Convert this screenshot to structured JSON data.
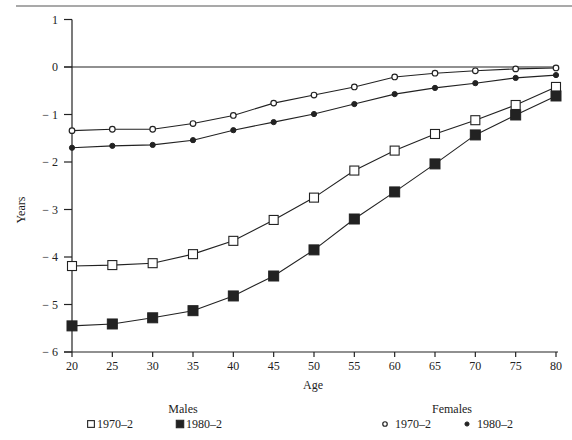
{
  "chart_data": {
    "type": "line",
    "title": "",
    "xlabel": "Age",
    "ylabel": "Years",
    "xlim": [
      20,
      80
    ],
    "ylim": [
      -6,
      1
    ],
    "x_ticks": [
      20,
      25,
      30,
      35,
      40,
      45,
      50,
      55,
      60,
      65,
      70,
      75,
      80
    ],
    "y_ticks": [
      1,
      0,
      -1,
      -2,
      -3,
      -4,
      -5,
      -6
    ],
    "y_tick_labels": [
      "1",
      "0",
      "− 1",
      "− 2",
      "− 3",
      "− 4",
      "− 5",
      "− 6"
    ],
    "grid": false,
    "reference_line_y": 0,
    "x": [
      20,
      25,
      30,
      35,
      40,
      45,
      50,
      55,
      60,
      65,
      70,
      75,
      80
    ],
    "series": [
      {
        "name": "Males 1970–2",
        "group": "Males",
        "marker": "open-square",
        "values": [
          -4.19,
          -4.17,
          -4.13,
          -3.94,
          -3.66,
          -3.22,
          -2.75,
          -2.18,
          -1.76,
          -1.41,
          -1.12,
          -0.8,
          -0.42
        ]
      },
      {
        "name": "Males 1980–2",
        "group": "Males",
        "marker": "filled-square",
        "values": [
          -5.45,
          -5.41,
          -5.28,
          -5.13,
          -4.82,
          -4.4,
          -3.85,
          -3.2,
          -2.63,
          -2.04,
          -1.43,
          -1.01,
          -0.61
        ]
      },
      {
        "name": "Females 1970–2",
        "group": "Females",
        "marker": "open-circle",
        "values": [
          -1.34,
          -1.31,
          -1.31,
          -1.19,
          -1.02,
          -0.76,
          -0.59,
          -0.42,
          -0.21,
          -0.13,
          -0.08,
          -0.04,
          -0.02
        ]
      },
      {
        "name": "Females 1980–2",
        "group": "Females",
        "marker": "filled-circle",
        "values": [
          -1.7,
          -1.66,
          -1.64,
          -1.54,
          -1.33,
          -1.16,
          -0.99,
          -0.78,
          -0.57,
          -0.44,
          -0.34,
          -0.23,
          -0.17
        ]
      }
    ],
    "legend": {
      "position": "bottom",
      "groups": [
        {
          "title": "Males",
          "items": [
            {
              "label": "1970–2",
              "marker": "open-square"
            },
            {
              "label": "1980–2",
              "marker": "filled-square"
            }
          ]
        },
        {
          "title": "Females",
          "items": [
            {
              "label": "1970–2",
              "marker": "open-circle"
            },
            {
              "label": "1980–2",
              "marker": "filled-circle"
            }
          ]
        }
      ]
    }
  },
  "colors": {
    "ink": "#222222",
    "background": "#ffffff"
  }
}
